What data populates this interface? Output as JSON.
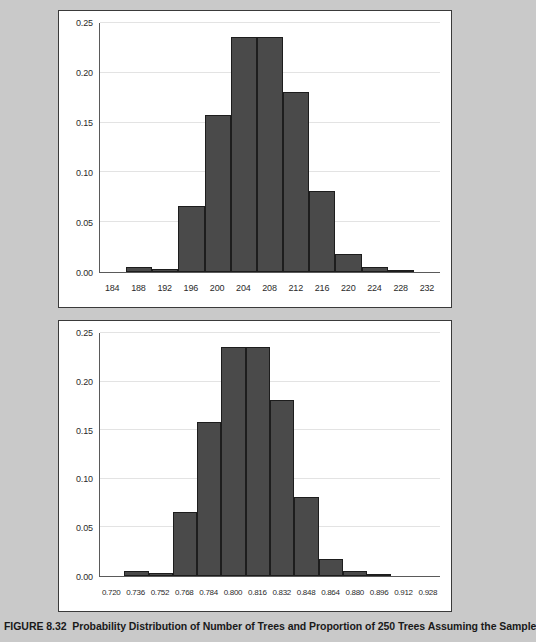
{
  "figure": {
    "caption_number": "FIGURE 8.32",
    "caption_text": "Probability Distribution of Number of Trees and Proportion of 250 Trees Assuming the Sample",
    "background_color": "#c9c9c9",
    "bar_color": "#4a4a4a",
    "gridline_color": "#e3e3e3",
    "axis_color": "#5a5a5a"
  },
  "chart_data": [
    {
      "type": "bar",
      "title": "",
      "xlabel": "",
      "ylabel": "",
      "grid": true,
      "legend": "none",
      "ylim": [
        0.0,
        0.25
      ],
      "yticks": [
        "0.00",
        "0.05",
        "0.10",
        "0.15",
        "0.20",
        "0.25"
      ],
      "ytick_values": [
        0.0,
        0.05,
        0.1,
        0.15,
        0.2,
        0.25
      ],
      "xticks": [
        "184",
        "188",
        "192",
        "196",
        "200",
        "204",
        "208",
        "212",
        "216",
        "220",
        "224",
        "228",
        "232"
      ],
      "xtick_values": [
        184,
        188,
        192,
        196,
        200,
        204,
        208,
        212,
        216,
        220,
        224,
        228,
        232
      ],
      "categories": [
        "184",
        "188",
        "192",
        "196",
        "200",
        "204",
        "208",
        "212",
        "216",
        "220",
        "224",
        "228",
        "232"
      ],
      "values": [
        0.0,
        0.005,
        0.003,
        0.066,
        0.158,
        0.236,
        0.236,
        0.181,
        0.081,
        0.018,
        0.005,
        0.001,
        0.0
      ]
    },
    {
      "type": "bar",
      "title": "",
      "xlabel": "",
      "ylabel": "",
      "grid": true,
      "legend": "none",
      "ylim": [
        0.0,
        0.25
      ],
      "yticks": [
        "0.00",
        "0.05",
        "0.10",
        "0.15",
        "0.20",
        "0.25"
      ],
      "ytick_values": [
        0.0,
        0.05,
        0.1,
        0.15,
        0.2,
        0.25
      ],
      "xticks": [
        "0.720",
        "0.736",
        "0.752",
        "0.768",
        "0.784",
        "0.800",
        "0.816",
        "0.832",
        "0.848",
        "0.864",
        "0.880",
        "0.896",
        "0.912",
        "0.928"
      ],
      "xtick_values": [
        0.72,
        0.736,
        0.752,
        0.768,
        0.784,
        0.8,
        0.816,
        0.832,
        0.848,
        0.864,
        0.88,
        0.896,
        0.912,
        0.928
      ],
      "categories": [
        "0.720",
        "0.736",
        "0.752",
        "0.768",
        "0.784",
        "0.800",
        "0.816",
        "0.832",
        "0.848",
        "0.864",
        "0.880",
        "0.896",
        "0.912",
        "0.928"
      ],
      "values": [
        0.0,
        0.005,
        0.003,
        0.066,
        0.158,
        0.236,
        0.236,
        0.181,
        0.081,
        0.018,
        0.005,
        0.001,
        0.0,
        0.0
      ]
    }
  ]
}
